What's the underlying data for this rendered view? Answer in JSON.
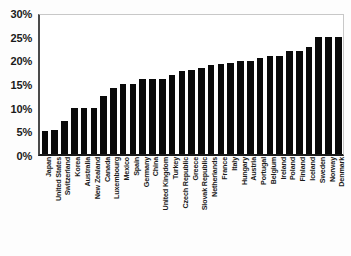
{
  "chart_data": {
    "type": "bar",
    "title": "",
    "xlabel": "",
    "ylabel": "",
    "ylim": [
      0,
      30
    ],
    "grid": false,
    "legend": null,
    "y_ticks": [
      "30%",
      "25%",
      "20%",
      "15%",
      "10%",
      "5%",
      "0%"
    ],
    "y_tick_values": [
      30,
      25,
      20,
      15,
      10,
      5,
      0
    ],
    "categories": [
      "Japan",
      "United States",
      "Switzerland",
      "Korea",
      "Australia",
      "New Zealand",
      "Canada",
      "Luxembourg",
      "Mexico",
      "Spain",
      "Germany",
      "China",
      "United Kingdom",
      "Turkey",
      "Czech Republic",
      "Greece",
      "Slovak Republic",
      "Netherlands",
      "France",
      "Italy",
      "Hungary",
      "Austria",
      "Portugal",
      "Belgium",
      "Ireland",
      "Poland",
      "Finland",
      "Iceland",
      "Sweden",
      "Norway",
      "Denmark"
    ],
    "values": [
      5.0,
      5.2,
      7.0,
      9.8,
      9.8,
      9.9,
      12.5,
      14.2,
      15.0,
      14.9,
      16.0,
      16.0,
      16.0,
      17.0,
      17.8,
      18.0,
      18.5,
      19.0,
      19.2,
      19.6,
      20.0,
      20.0,
      20.5,
      21.0,
      21.0,
      22.0,
      22.0,
      23.0,
      25.0,
      25.0,
      25.0
    ]
  }
}
